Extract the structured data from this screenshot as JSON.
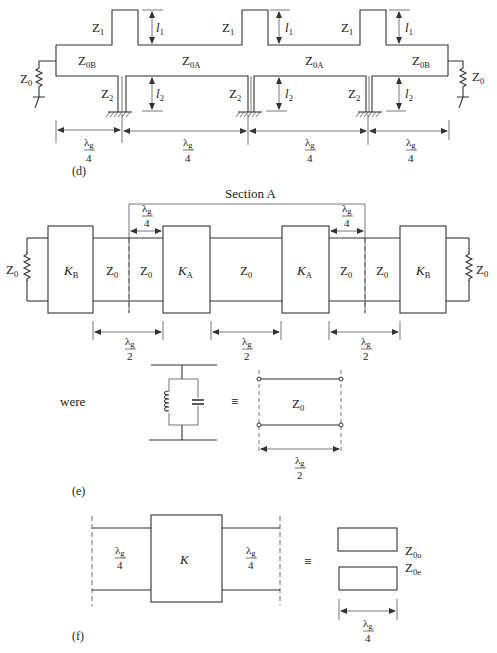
{
  "diagram": {
    "panel_d": {
      "label": "(d)",
      "stubs": {
        "upper_impedance": "Z",
        "upper_sub": "1",
        "lower_impedance": "Z",
        "lower_sub": "2"
      },
      "lengths": {
        "l1": "l",
        "l1_sub": "1",
        "l2": "l",
        "l2_sub": "2"
      },
      "lines": {
        "outer": "Z",
        "outer_sub": "0B",
        "inner": "Z",
        "inner_sub": "0A"
      },
      "termination": {
        "impedance": "Z",
        "sub": "0"
      },
      "spacing": {
        "numerator": "λ",
        "num_sub": "g",
        "denominator": "4"
      }
    },
    "panel_e": {
      "label": "(e)",
      "section_title": "Section A",
      "inverters": {
        "outer": "K",
        "outer_sub": "B",
        "inner": "K",
        "inner_sub": "A"
      },
      "line_impedance": {
        "symbol": "Z",
        "sub": "0"
      },
      "quarter_wave": {
        "numerator": "λ",
        "num_sub": "g",
        "denominator": "4"
      },
      "half_wave": {
        "numerator": "λ",
        "num_sub": "g",
        "denominator": "2"
      },
      "equivalence": {
        "word": "were",
        "equals": "≡",
        "line_impedance": "Z",
        "line_sub": "0",
        "length": {
          "numerator": "λ",
          "num_sub": "g",
          "denominator": "2"
        }
      }
    },
    "panel_f": {
      "label": "(f)",
      "inverter": "K",
      "quarter_wave": {
        "numerator": "λ",
        "num_sub": "g",
        "denominator": "4"
      },
      "equals": "≡",
      "coupled_lines": {
        "odd": "Z",
        "odd_sub": "0o",
        "even": "Z",
        "even_sub": "0e"
      },
      "length": {
        "numerator": "λ",
        "num_sub": "g",
        "denominator": "4"
      }
    }
  }
}
